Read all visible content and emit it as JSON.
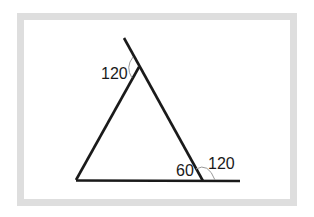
{
  "diagram": {
    "type": "triangle-with-exterior-angles",
    "frame_color": "#dedede",
    "line_color": "#1a1a1a",
    "arc_color": "#999999",
    "labels": {
      "top_exterior_angle": "120",
      "bottom_right_interior_angle": "60",
      "bottom_right_exterior_angle": "120"
    }
  }
}
